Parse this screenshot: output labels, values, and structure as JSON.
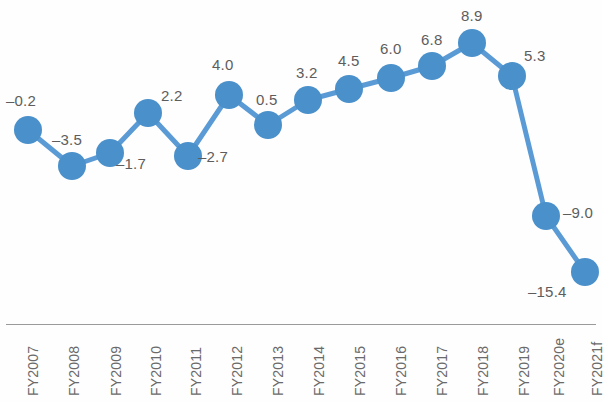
{
  "chart_data": {
    "type": "line",
    "title": "",
    "subtitle": "",
    "xlabel": "",
    "ylabel": "",
    "grid": false,
    "legend": "none",
    "ylim": [
      -17,
      10
    ],
    "categories": [
      "FY2007",
      "FY2008",
      "FY2009",
      "FY2010",
      "FY2011",
      "FY2012",
      "FY2013",
      "FY2014",
      "FY2015",
      "FY2016",
      "FY2017",
      "FY2018",
      "FY2019",
      "FY2020e",
      "FY2021f"
    ],
    "values": [
      -0.2,
      -3.5,
      -1.7,
      2.2,
      -2.7,
      4.0,
      0.5,
      3.2,
      4.5,
      6.0,
      6.8,
      8.9,
      5.3,
      -9.0,
      -15.4
    ],
    "data_labels": [
      "–0.2",
      "–3.5",
      "–1.7",
      "2.2",
      "–2.7",
      "4.0",
      "0.5",
      "3.2",
      "4.5",
      "6.0",
      "6.8",
      "8.9",
      "5.3",
      "–9.0",
      "–15.4"
    ],
    "series": [
      {
        "name": "",
        "values": [
          -0.2,
          -3.5,
          -1.7,
          2.2,
          -2.7,
          4.0,
          0.5,
          3.2,
          4.5,
          6.0,
          6.8,
          8.9,
          5.3,
          -9.0,
          -15.4
        ]
      }
    ],
    "colors": {
      "line": "#5b9bd5",
      "marker": "#4a90ca",
      "value_text": "#5d5d5d",
      "category_text": "#6a6a6a",
      "axis": "#9a9a9a",
      "background": "#fefefe"
    },
    "points": [
      {
        "cat": "FY2007",
        "value": -0.2,
        "label": "–0.2",
        "px": 28,
        "py": 130,
        "lx": 6,
        "ly": 92,
        "cx": 25
      },
      {
        "cat": "FY2008",
        "value": -3.5,
        "label": "–3.5",
        "px": 72,
        "py": 166,
        "lx": 52,
        "ly": 131,
        "cx": 66
      },
      {
        "cat": "FY2009",
        "value": -1.7,
        "label": "–1.7",
        "px": 110,
        "py": 153,
        "lx": 116,
        "ly": 155,
        "cx": 108
      },
      {
        "cat": "FY2010",
        "value": 2.2,
        "label": "2.2",
        "px": 148,
        "py": 113,
        "lx": 161,
        "ly": 87,
        "cx": 148
      },
      {
        "cat": "FY2011",
        "value": -2.7,
        "label": "–2.7",
        "px": 188,
        "py": 156,
        "lx": 198,
        "ly": 148,
        "cx": 188
      },
      {
        "cat": "FY2012",
        "value": 4.0,
        "label": "4.0",
        "px": 229,
        "py": 95,
        "lx": 212,
        "ly": 56,
        "cx": 229
      },
      {
        "cat": "FY2013",
        "value": 0.5,
        "label": "0.5",
        "px": 268,
        "py": 125,
        "lx": 256,
        "ly": 91,
        "cx": 270
      },
      {
        "cat": "FY2014",
        "value": 3.2,
        "label": "3.2",
        "px": 308,
        "py": 100,
        "lx": 296,
        "ly": 64,
        "cx": 311
      },
      {
        "cat": "FY2015",
        "value": 4.5,
        "label": "4.5",
        "px": 349,
        "py": 89,
        "lx": 338,
        "ly": 52,
        "cx": 352
      },
      {
        "cat": "FY2016",
        "value": 6.0,
        "label": "6.0",
        "px": 391,
        "py": 78,
        "lx": 380,
        "ly": 40,
        "cx": 393
      },
      {
        "cat": "FY2017",
        "value": 6.8,
        "label": "6.8",
        "px": 432,
        "py": 66,
        "lx": 421,
        "ly": 31,
        "cx": 434
      },
      {
        "cat": "FY2018",
        "value": 8.9,
        "label": "8.9",
        "px": 472,
        "py": 43,
        "lx": 461,
        "ly": 7,
        "cx": 475
      },
      {
        "cat": "FY2019",
        "value": 5.3,
        "label": "5.3",
        "px": 512,
        "py": 76,
        "lx": 524,
        "ly": 47,
        "cx": 516
      },
      {
        "cat": "FY2020e",
        "value": -9.0,
        "label": "–9.0",
        "px": 546,
        "py": 216,
        "lx": 563,
        "ly": 204,
        "cx": 551
      },
      {
        "cat": "FY2021f",
        "value": -15.4,
        "label": "–15.4",
        "px": 585,
        "py": 272,
        "lx": 528,
        "ly": 283,
        "cx": 589
      }
    ]
  }
}
